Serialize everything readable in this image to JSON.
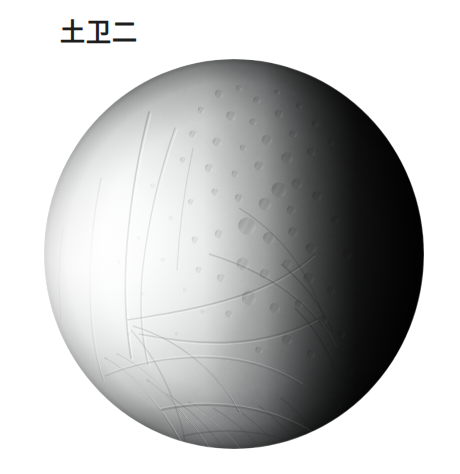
{
  "page": {
    "background_color": "#ffffff",
    "width": 460,
    "height": 474
  },
  "caption": {
    "text": "土卫二",
    "color": "#1d1d1d"
  },
  "image": {
    "subject_name": "enceladus-moon",
    "type": "grayscale-photograph",
    "description": "Grayscale spacecraft photograph of Saturn's icy moon Enceladus, lit from the left, with a dark terminator on the right limb",
    "disc": {
      "center_x": 234,
      "center_y": 254,
      "radius_x": 191,
      "radius_y": 196
    },
    "palette": {
      "limb_highlight": "#fbfbfb",
      "bright_terrain": "#eceded",
      "mid_terrain": "#b9bbbb",
      "shaded_terrain": "#6e7071",
      "terminator": "#252627",
      "night_side": "#020202"
    },
    "features": [
      {
        "name": "cratered-plains",
        "location": "upper-center"
      },
      {
        "name": "crater-chain",
        "location": "center-right"
      },
      {
        "name": "grooved-terrain",
        "location": "lower-left"
      },
      {
        "name": "linear-fractures",
        "location": "left-limb"
      },
      {
        "name": "ridge-belt",
        "location": "lower-center"
      },
      {
        "name": "terminator-shadow",
        "location": "right-limb"
      }
    ]
  }
}
